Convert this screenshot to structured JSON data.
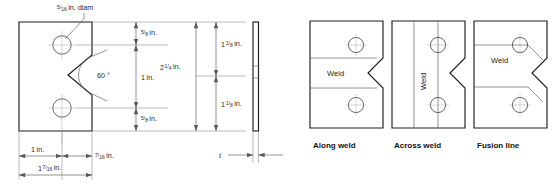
{
  "figure": {
    "left_drawing": {
      "name": "charpy-specimen-plan-view",
      "hole_diam_label": {
        "whole": "",
        "num": "5",
        "den": "16",
        "unit": "in. diam"
      },
      "angle_label": "60 °",
      "vertical_dims": [
        {
          "whole": "",
          "num": "5",
          "den": "8",
          "unit": "in."
        },
        {
          "whole": "1",
          "num": "",
          "den": "",
          "unit": "in."
        },
        {
          "whole": "",
          "num": "5",
          "den": "8",
          "unit": "in."
        }
      ],
      "overall_vertical_dim": {
        "whole": "2",
        "num": "1",
        "den": "4",
        "unit": "in."
      },
      "right_vertical_dims": [
        {
          "whole": "1",
          "num": "1",
          "den": "8",
          "unit": "in."
        },
        {
          "whole": "1",
          "num": "1",
          "den": "8",
          "unit": "in."
        }
      ],
      "horizontal_dims": [
        {
          "whole": "1",
          "num": "",
          "den": "",
          "unit": "in."
        },
        {
          "whole": "",
          "num": "7",
          "den": "16",
          "unit": "in."
        },
        {
          "whole": "1",
          "num": "7",
          "den": "16",
          "unit": "in."
        }
      ],
      "thickness_label": "t"
    },
    "right_panels": [
      {
        "name": "along-weld",
        "caption": "Along weld",
        "weld_label": "Weld",
        "orientation": "horizontal"
      },
      {
        "name": "across-weld",
        "caption": "Across weld",
        "weld_label": "Weld",
        "orientation": "vertical"
      },
      {
        "name": "fusion-line",
        "caption": "Fusion line",
        "weld_label": "Weld",
        "orientation": "horizontal"
      }
    ]
  },
  "colors": {
    "outline": "#1d1d1d",
    "thin": "#8d8d8d",
    "text": "#1a1a1a",
    "background": "#ffffff"
  }
}
